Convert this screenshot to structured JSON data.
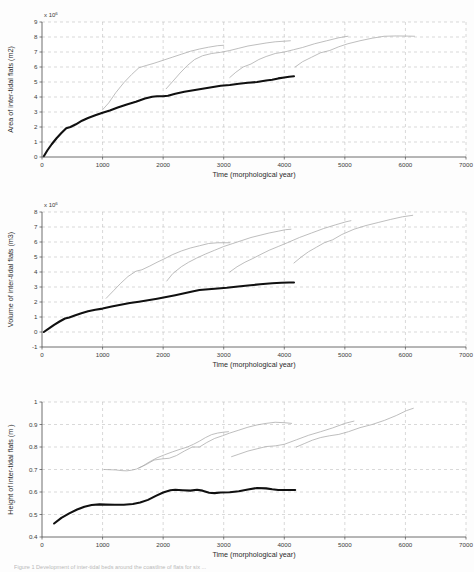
{
  "figure": {
    "caption": "Figure 1 Development of inter-tidal beds around the coastline of flats for six ...",
    "background_color": "#fdfdfd",
    "main_series_color": "#101010",
    "sub_series_color": "#a8a8a8",
    "grid_color": "#bfbfbf",
    "axis_color": "#4a4a4a"
  },
  "chart_data": [
    {
      "type": "line",
      "title": "",
      "xlabel": "Time (morphological year)",
      "ylabel": "Area of inter-tidal flats (m2)",
      "exponent_label": "x 10",
      "exponent_value": "6",
      "xlim": [
        0,
        7000
      ],
      "ylim": [
        0,
        9
      ],
      "xticks": [
        0,
        1000,
        2000,
        3000,
        4000,
        5000,
        6000,
        7000
      ],
      "yticks": [
        0,
        1,
        2,
        3,
        4,
        5,
        6,
        7,
        8,
        9
      ],
      "grid": true,
      "legend": "none",
      "series": [
        {
          "name": "main-run",
          "style": "thick-black",
          "x": [
            30,
            90,
            160,
            240,
            320,
            400,
            470,
            560,
            660,
            760,
            880,
            1000,
            1120,
            1250,
            1400,
            1550,
            1700,
            1820,
            1900,
            2000,
            2080,
            2200,
            2350,
            2500,
            2650,
            2800,
            2950,
            3100,
            3250,
            3400,
            3550,
            3700,
            3800,
            3900,
            4000,
            4080,
            4160
          ],
          "y": [
            0.05,
            0.45,
            0.85,
            1.25,
            1.6,
            1.92,
            2.0,
            2.18,
            2.42,
            2.6,
            2.78,
            2.95,
            3.1,
            3.3,
            3.5,
            3.68,
            3.9,
            4.02,
            4.05,
            4.05,
            4.08,
            4.22,
            4.35,
            4.45,
            4.55,
            4.65,
            4.75,
            4.8,
            4.88,
            4.95,
            5.0,
            5.1,
            5.15,
            5.24,
            5.3,
            5.35,
            5.38
          ]
        },
        {
          "name": "sub-run-1",
          "style": "thin-grey",
          "x": [
            1000,
            1100,
            1220,
            1350,
            1480,
            1600,
            1720,
            1850,
            2000,
            2150,
            2300,
            2450,
            2600,
            2750,
            2900,
            3000
          ],
          "y": [
            3.15,
            3.6,
            4.3,
            4.95,
            5.5,
            5.95,
            6.1,
            6.25,
            6.45,
            6.65,
            6.85,
            7.05,
            7.2,
            7.32,
            7.42,
            7.45
          ]
        },
        {
          "name": "sub-run-2",
          "style": "thin-grey",
          "x": [
            2050,
            2150,
            2280,
            2400,
            2520,
            2650,
            2800,
            2950,
            3100,
            3250,
            3400,
            3550,
            3700,
            3850,
            4000,
            4100
          ],
          "y": [
            4.55,
            5.0,
            5.6,
            6.1,
            6.5,
            6.75,
            6.9,
            6.98,
            7.1,
            7.25,
            7.4,
            7.5,
            7.6,
            7.68,
            7.72,
            7.75
          ]
        },
        {
          "name": "sub-run-3",
          "style": "thin-grey",
          "x": [
            3100,
            3200,
            3320,
            3450,
            3580,
            3700,
            3850,
            4000,
            4150,
            4300,
            4500,
            4700,
            4900,
            5050
          ],
          "y": [
            5.3,
            5.65,
            6.0,
            6.2,
            6.5,
            6.7,
            6.9,
            7.0,
            7.15,
            7.3,
            7.55,
            7.75,
            7.95,
            8.05
          ]
        },
        {
          "name": "sub-run-4",
          "style": "thin-grey",
          "x": [
            4180,
            4300,
            4450,
            4600,
            4750,
            4900,
            5050,
            5250,
            5450,
            5650,
            5850,
            6050,
            6150
          ],
          "y": [
            6.0,
            6.35,
            6.65,
            6.95,
            7.1,
            7.35,
            7.55,
            7.75,
            7.92,
            8.05,
            8.07,
            8.06,
            8.05
          ]
        }
      ]
    },
    {
      "type": "line",
      "title": "",
      "xlabel": "Time (morphological year)",
      "ylabel": "Volume of inter-tidal flats (m3)",
      "exponent_label": "x 10",
      "exponent_value": "6",
      "xlim": [
        0,
        7000
      ],
      "ylim": [
        -1,
        8
      ],
      "xticks": [
        0,
        1000,
        2000,
        3000,
        4000,
        5000,
        6000,
        7000
      ],
      "yticks": [
        -1,
        0,
        1,
        2,
        3,
        4,
        5,
        6,
        7,
        8
      ],
      "grid": true,
      "legend": "none",
      "series": [
        {
          "name": "main-run",
          "style": "thick-black",
          "x": [
            30,
            110,
            200,
            290,
            380,
            450,
            540,
            650,
            760,
            880,
            1000,
            1150,
            1300,
            1450,
            1600,
            1750,
            1900,
            2050,
            2200,
            2350,
            2500,
            2600,
            2750,
            2900,
            3050,
            3200,
            3400,
            3600,
            3800,
            3950,
            4080,
            4160
          ],
          "y": [
            0.0,
            0.22,
            0.48,
            0.7,
            0.9,
            0.97,
            1.1,
            1.25,
            1.38,
            1.48,
            1.56,
            1.7,
            1.82,
            1.93,
            2.02,
            2.12,
            2.22,
            2.33,
            2.45,
            2.58,
            2.72,
            2.8,
            2.85,
            2.9,
            2.95,
            3.02,
            3.1,
            3.18,
            3.25,
            3.28,
            3.3,
            3.3
          ]
        },
        {
          "name": "sub-run-1",
          "style": "thin-grey",
          "x": [
            1060,
            1180,
            1300,
            1420,
            1550,
            1650,
            1780,
            1900,
            2030,
            2150,
            2300,
            2450,
            2600,
            2750,
            2900,
            3020,
            3100
          ],
          "y": [
            2.25,
            2.75,
            3.25,
            3.7,
            4.05,
            4.15,
            4.4,
            4.65,
            4.9,
            5.15,
            5.4,
            5.6,
            5.75,
            5.9,
            5.95,
            5.95,
            5.95
          ]
        },
        {
          "name": "sub-run-2",
          "style": "thin-grey",
          "x": [
            2060,
            2160,
            2300,
            2420,
            2550,
            2700,
            2850,
            3000,
            3150,
            3300,
            3450,
            3600,
            3750,
            3900,
            4020,
            4110
          ],
          "y": [
            3.4,
            3.9,
            4.35,
            4.65,
            4.92,
            5.2,
            5.45,
            5.7,
            5.9,
            6.1,
            6.3,
            6.45,
            6.6,
            6.72,
            6.82,
            6.85
          ]
        },
        {
          "name": "sub-run-3",
          "style": "thin-grey",
          "x": [
            3100,
            3220,
            3350,
            3480,
            3600,
            3750,
            3900,
            4050,
            4250,
            4450,
            4650,
            4850,
            5020,
            5100
          ],
          "y": [
            4.0,
            4.35,
            4.65,
            4.9,
            5.15,
            5.45,
            5.7,
            5.95,
            6.3,
            6.6,
            6.9,
            7.15,
            7.35,
            7.42
          ]
        },
        {
          "name": "sub-run-4",
          "style": "thin-grey",
          "x": [
            4160,
            4280,
            4400,
            4530,
            4660,
            4800,
            4950,
            5150,
            5350,
            5550,
            5750,
            5950,
            6120
          ],
          "y": [
            4.6,
            5.0,
            5.35,
            5.65,
            5.95,
            6.15,
            6.5,
            6.85,
            7.1,
            7.3,
            7.5,
            7.68,
            7.78
          ]
        }
      ]
    },
    {
      "type": "line",
      "title": "",
      "xlabel": "Time (morphological year)",
      "ylabel": "Height of inter-tidal flats (m )",
      "exponent_label": "",
      "exponent_value": "",
      "xlim": [
        0,
        7000
      ],
      "ylim": [
        0.4,
        1.0
      ],
      "xticks": [
        0,
        1000,
        2000,
        3000,
        4000,
        5000,
        6000,
        7000
      ],
      "yticks": [
        0.4,
        0.5,
        0.6,
        0.7,
        0.8,
        0.9,
        1.0
      ],
      "grid": true,
      "legend": "none",
      "series": [
        {
          "name": "main-run",
          "style": "thick-black",
          "x": [
            200,
            320,
            450,
            580,
            700,
            820,
            950,
            1050,
            1200,
            1350,
            1500,
            1620,
            1750,
            1880,
            2000,
            2120,
            2200,
            2320,
            2450,
            2560,
            2650,
            2760,
            2850,
            2950,
            3100,
            3250,
            3400,
            3550,
            3700,
            3800,
            3900,
            4000,
            4100,
            4180
          ],
          "y": [
            0.46,
            0.485,
            0.505,
            0.522,
            0.534,
            0.542,
            0.545,
            0.544,
            0.543,
            0.543,
            0.547,
            0.553,
            0.565,
            0.583,
            0.598,
            0.608,
            0.61,
            0.608,
            0.606,
            0.61,
            0.606,
            0.597,
            0.595,
            0.598,
            0.599,
            0.603,
            0.611,
            0.618,
            0.616,
            0.612,
            0.609,
            0.609,
            0.609,
            0.609
          ]
        },
        {
          "name": "sub-run-1",
          "style": "thin-grey",
          "x": [
            1030,
            1120,
            1220,
            1320,
            1400,
            1480,
            1560,
            1660,
            1780,
            1900,
            2020,
            2150,
            2280,
            2400,
            2500,
            2600,
            2700,
            2800,
            2900,
            3000,
            3080
          ],
          "y": [
            0.7,
            0.699,
            0.698,
            0.695,
            0.694,
            0.697,
            0.702,
            0.715,
            0.735,
            0.752,
            0.765,
            0.778,
            0.79,
            0.8,
            0.812,
            0.826,
            0.842,
            0.855,
            0.862,
            0.866,
            0.868
          ]
        },
        {
          "name": "sub-run-2",
          "style": "thin-grey",
          "x": [
            1600,
            1720,
            1850,
            1980,
            2100,
            2220,
            2350,
            2480,
            2600,
            2720,
            2850,
            2980,
            3100,
            3250,
            3400,
            3550,
            3700,
            3850,
            4000,
            4120
          ],
          "y": [
            0.707,
            0.722,
            0.742,
            0.747,
            0.75,
            0.762,
            0.782,
            0.8,
            0.8,
            0.82,
            0.838,
            0.85,
            0.862,
            0.875,
            0.888,
            0.898,
            0.905,
            0.91,
            0.908,
            0.905
          ]
        },
        {
          "name": "sub-run-3",
          "style": "thin-grey",
          "x": [
            3130,
            3250,
            3400,
            3550,
            3700,
            3850,
            4000,
            4200,
            4400,
            4600,
            4800,
            5000,
            5150
          ],
          "y": [
            0.757,
            0.768,
            0.782,
            0.792,
            0.802,
            0.805,
            0.812,
            0.832,
            0.852,
            0.868,
            0.885,
            0.905,
            0.915
          ]
        },
        {
          "name": "sub-run-4",
          "style": "thin-grey",
          "x": [
            4200,
            4330,
            4460,
            4600,
            4750,
            4900,
            5060,
            5250,
            5450,
            5650,
            5850,
            6020,
            6130
          ],
          "y": [
            0.8,
            0.815,
            0.83,
            0.842,
            0.85,
            0.856,
            0.868,
            0.886,
            0.9,
            0.918,
            0.94,
            0.962,
            0.972
          ]
        }
      ]
    }
  ]
}
